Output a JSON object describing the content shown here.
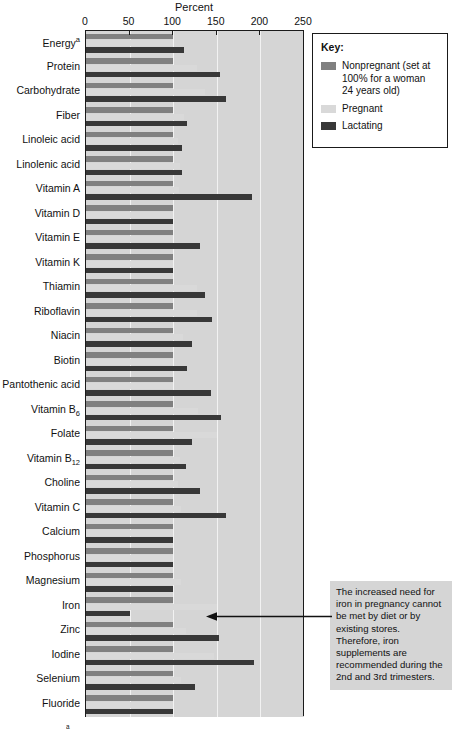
{
  "chart_data": {
    "type": "bar",
    "orientation": "horizontal",
    "title": "",
    "xlabel": "Percent",
    "ylabel": "",
    "xlim": [
      0,
      250
    ],
    "xticks": [
      0,
      50,
      100,
      150,
      200,
      250
    ],
    "grid": true,
    "legend_position": "top-right",
    "categories": [
      "Energy",
      "Protein",
      "Carbohydrate",
      "Fiber",
      "Linoleic acid",
      "Linolenic acid",
      "Vitamin A",
      "Vitamin D",
      "Vitamin E",
      "Vitamin K",
      "Thiamin",
      "Riboflavin",
      "Niacin",
      "Biotin",
      "Pantothenic acid",
      "Vitamin B6",
      "Folate",
      "Vitamin B12",
      "Choline",
      "Vitamin C",
      "Calcium",
      "Phosphorus",
      "Magnesium",
      "Iron",
      "Zinc",
      "Iodine",
      "Selenium",
      "Fluoride"
    ],
    "category_labels": [
      "Energy<sup>a</sup>",
      "Protein",
      "Carbohydrate",
      "Fiber",
      "Linoleic acid",
      "Linolenic acid",
      "Vitamin A",
      "Vitamin D",
      "Vitamin E",
      "Vitamin K",
      "Thiamin",
      "Riboflavin",
      "Niacin",
      "Biotin",
      "Pantothenic acid",
      "Vitamin B<sub>6</sub>",
      "Folate",
      "Vitamin B<sub>12</sub>",
      "Choline",
      "Vitamin C",
      "Calcium",
      "Phosphorus",
      "Magnesium",
      "Iron",
      "Zinc",
      "Iodine",
      "Selenium",
      "Fluoride"
    ],
    "series": [
      {
        "name": "Nonpregnant",
        "color": "#808080",
        "values": [
          100,
          100,
          100,
          100,
          100,
          100,
          100,
          100,
          100,
          100,
          100,
          100,
          100,
          100,
          100,
          100,
          100,
          100,
          100,
          100,
          100,
          100,
          100,
          100,
          100,
          100,
          100,
          100
        ]
      },
      {
        "name": "Pregnant",
        "color": "#d9d9d9",
        "values": [
          100,
          127,
          136,
          112,
          105,
          108,
          107,
          100,
          100,
          100,
          127,
          127,
          111,
          100,
          100,
          129,
          150,
          108,
          105,
          109,
          100,
          100,
          109,
          150,
          115,
          147,
          109,
          100
        ]
      },
      {
        "name": "Lactating",
        "color": "#383838",
        "values": [
          112,
          154,
          160,
          116,
          110,
          110,
          190,
          100,
          131,
          100,
          136,
          145,
          121,
          116,
          143,
          155,
          121,
          115,
          131,
          160,
          100,
          100,
          100,
          50,
          152,
          193,
          125,
          100
        ]
      }
    ]
  },
  "axis": {
    "title": "Percent",
    "ticks": [
      "0",
      "50",
      "100",
      "150",
      "200",
      "250"
    ]
  },
  "legend": {
    "title": "Key:",
    "items": [
      {
        "label": "Nonpregnant (set at 100% for a woman 24 years old)",
        "color": "#808080",
        "swatch_name": "legend-swatch-nonpregnant"
      },
      {
        "label": "Pregnant",
        "color": "#d9d9d9",
        "swatch_name": "legend-swatch-pregnant"
      },
      {
        "label": "Lactating",
        "color": "#383838",
        "swatch_name": "legend-swatch-lactating"
      }
    ]
  },
  "annotation": {
    "text": "The increased need for iron in pregnancy cannot be met by diet or by existing stores. Therefore, iron supplements are recommended during the 2nd and 3rd trimesters.",
    "arrow_name": "annotation-arrow"
  },
  "footnote": {
    "marker": "a",
    "text": ""
  }
}
